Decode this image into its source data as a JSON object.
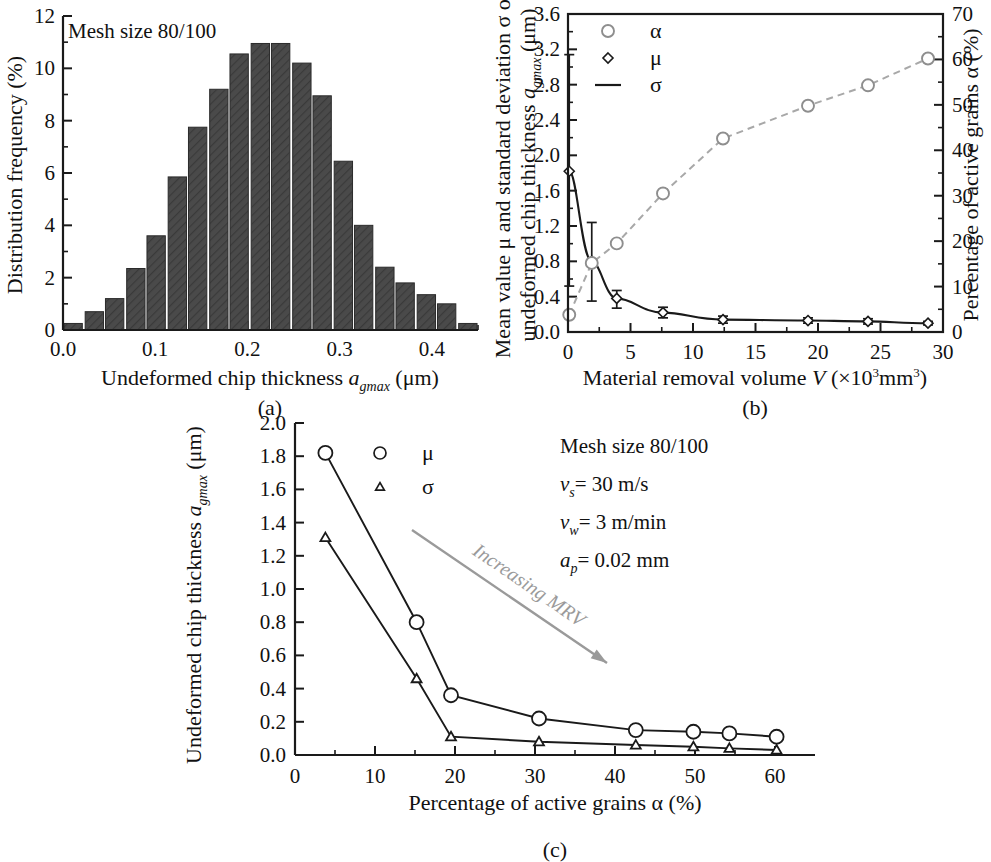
{
  "figure": {
    "panels": [
      "(a)",
      "(b)",
      "(c)"
    ]
  },
  "panel_a": {
    "caption": "(a)",
    "annotation": "Mesh size 80/100",
    "ylabel": "Distribution frequency (%)",
    "xlabel_pre": "Undeformed chip thickness ",
    "xlabel_sym": "a",
    "xlabel_sub": "gmax",
    "xlabel_post": " (μm)",
    "yticks": [
      "0",
      "2",
      "4",
      "6",
      "8",
      "10",
      "12"
    ],
    "xticks": [
      "0.0",
      "0.1",
      "0.2",
      "0.3",
      "0.4"
    ]
  },
  "panel_b": {
    "caption": "(b)",
    "ylabel_l1": "Mean value μ and standard deviation σ of",
    "ylabel_l2_pre": "undeformed chip thickness ",
    "ylabel_l2_sym": "a",
    "ylabel_l2_sub": "gmax",
    "ylabel_l2_post": " (μm)",
    "ylabel_right": "Percentage of active grains α (%)",
    "xlabel_pre": "Material removal volume ",
    "xlabel_sym": "V",
    "xlabel_post": " (×10",
    "xlabel_sup1": "3",
    "xlabel_mid": "mm",
    "xlabel_sup2": "3",
    "xlabel_end": ")",
    "yticks_left": [
      "0.0",
      "0.4",
      "0.8",
      "1.2",
      "1.6",
      "2.0",
      "2.4",
      "2.8",
      "3.2",
      "3.6"
    ],
    "yticks_right": [
      "0",
      "10",
      "20",
      "30",
      "40",
      "50",
      "60",
      "70"
    ],
    "xticks": [
      "0",
      "5",
      "10",
      "15",
      "20",
      "25",
      "30"
    ],
    "legend": [
      {
        "symbol": "circle",
        "label": "α"
      },
      {
        "symbol": "diamond",
        "label": "μ"
      },
      {
        "symbol": "line",
        "label": "σ"
      }
    ]
  },
  "panel_c": {
    "caption": "(c)",
    "ylabel_pre": "Undeformed chip thickness ",
    "ylabel_sym": "a",
    "ylabel_sub": "gmax",
    "ylabel_post": " (μm)",
    "xlabel": "Percentage of active grains α (%)",
    "yticks": [
      "0.0",
      "0.2",
      "0.4",
      "0.6",
      "0.8",
      "1.0",
      "1.2",
      "1.4",
      "1.6",
      "1.8",
      "2.0"
    ],
    "xticks": [
      "0",
      "10",
      "20",
      "30",
      "40",
      "50",
      "60"
    ],
    "legend": [
      {
        "symbol": "circle",
        "label": "μ"
      },
      {
        "symbol": "triangle",
        "label": "σ"
      }
    ],
    "params": [
      {
        "text": "Mesh size 80/100"
      },
      {
        "sym": "v",
        "sub": "s",
        "text": "= 30 m/s"
      },
      {
        "sym": "v",
        "sub": "w",
        "text": "= 3 m/min"
      },
      {
        "sym": "a",
        "sub": "p",
        "text": "= 0.02 mm"
      }
    ],
    "arrow_label": "Increasing MRV",
    "arrow_color": "#9a9a9a"
  },
  "colors": {
    "bar_fill": "#4a4a4a",
    "axis": "#1a1a1a",
    "dashed": "#a8a8a8",
    "arrow": "#9a9a9a"
  },
  "chart_data": [
    {
      "type": "bar",
      "title": "Mesh size 80/100",
      "xlabel": "Undeformed chip thickness a_gmax (μm)",
      "ylabel": "Distribution frequency (%)",
      "xlim": [
        0.0,
        0.45
      ],
      "ylim": [
        0,
        12
      ],
      "bin_width": 0.0225,
      "grid": false,
      "categories": [
        "0.011",
        "0.034",
        "0.056",
        "0.079",
        "0.101",
        "0.124",
        "0.146",
        "0.169",
        "0.191",
        "0.214",
        "0.236",
        "0.259",
        "0.281",
        "0.304",
        "0.326",
        "0.349",
        "0.371",
        "0.394",
        "0.416",
        "0.439"
      ],
      "values": [
        0.25,
        0.7,
        1.2,
        2.35,
        3.6,
        5.85,
        7.75,
        9.2,
        10.55,
        10.95,
        10.95,
        10.2,
        8.95,
        6.45,
        4.0,
        2.4,
        1.8,
        1.35,
        1.0,
        0.25
      ]
    },
    {
      "type": "line",
      "title": "",
      "xlabel": "Material removal volume V (×10^3 mm^3)",
      "ylabel": "Mean value μ and standard deviation σ of undeformed chip thickness a_gmax (μm)",
      "ylabel_right": "Percentage of active grains α (%)",
      "xlim": [
        0,
        30
      ],
      "ylim": [
        0.0,
        3.6
      ],
      "ylim_right": [
        0,
        70
      ],
      "grid": false,
      "legend_position": "top-left",
      "series": [
        {
          "name": "μ",
          "axis": "left",
          "marker": "diamond",
          "linestyle": "solid",
          "x": [
            0.1,
            1.9,
            3.9,
            7.6,
            12.4,
            19.2,
            24.0,
            28.8
          ],
          "y": [
            1.82,
            0.8,
            0.38,
            0.22,
            0.14,
            0.13,
            0.12,
            0.1
          ],
          "yerr_low": [
            1.3,
            0.45,
            0.11,
            0.06,
            0.04,
            0.03,
            0.03,
            0.02
          ],
          "yerr_high": [
            1.32,
            0.44,
            0.09,
            0.06,
            0.04,
            0.03,
            0.03,
            0.02
          ]
        },
        {
          "name": "α",
          "axis": "right",
          "marker": "circle",
          "linestyle": "dashed",
          "x": [
            0.1,
            1.9,
            3.9,
            7.6,
            12.4,
            19.2,
            24.0,
            28.8
          ],
          "y": [
            3.8,
            15.2,
            19.5,
            30.5,
            42.6,
            49.8,
            54.3,
            60.2
          ]
        }
      ]
    },
    {
      "type": "line",
      "title": "",
      "xlabel": "Percentage of active grains α (%)",
      "ylabel": "Undeformed chip thickness a_gmax (μm)",
      "xlim": [
        0,
        65
      ],
      "ylim": [
        0.0,
        2.0
      ],
      "grid": false,
      "legend_position": "top-center",
      "annotations": [
        "Mesh size 80/100",
        "v_s = 30 m/s",
        "v_w = 3 m/min",
        "a_p = 0.02 mm",
        "Increasing MRV"
      ],
      "series": [
        {
          "name": "μ",
          "marker": "circle",
          "x": [
            3.8,
            15.2,
            19.5,
            30.5,
            42.6,
            49.8,
            54.3,
            60.2
          ],
          "y": [
            1.82,
            0.8,
            0.36,
            0.22,
            0.15,
            0.14,
            0.13,
            0.11
          ]
        },
        {
          "name": "σ",
          "marker": "triangle",
          "x": [
            3.8,
            15.2,
            19.5,
            30.5,
            42.6,
            49.8,
            54.3,
            60.2
          ],
          "y": [
            1.31,
            0.46,
            0.11,
            0.08,
            0.06,
            0.05,
            0.04,
            0.03
          ]
        }
      ]
    }
  ]
}
